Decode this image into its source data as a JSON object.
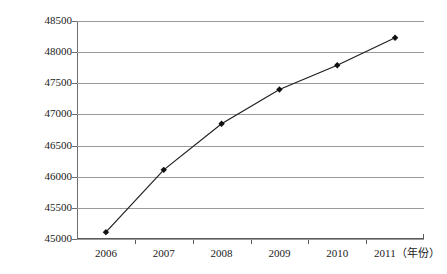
{
  "chart_data": {
    "type": "line",
    "title": "",
    "xlabel": "年份",
    "ylabel": "",
    "categories": [
      "2006",
      "2007",
      "2008",
      "2009",
      "2010",
      "2011"
    ],
    "values": [
      45110,
      46110,
      46850,
      47400,
      47790,
      48230
    ],
    "series": [
      {
        "name": "",
        "values": [
          45110,
          46110,
          46850,
          47400,
          47790,
          48230
        ]
      }
    ],
    "ylim": [
      45000,
      48500
    ],
    "y_ticks": [
      45000,
      45500,
      46000,
      46500,
      47000,
      47500,
      48000,
      48500
    ],
    "y_tick_labels": [
      "45000",
      "45500",
      "46000",
      "46500",
      "47000",
      "47500",
      "48000",
      "48500"
    ],
    "x_tick_labels": [
      "2006",
      "2007",
      "2008",
      "2009",
      "2010",
      "2011"
    ],
    "x_last_label_full": "2011（年份）",
    "x_axis_unit_annotation": "（年份）",
    "grid": true,
    "grid_axis": "y",
    "legend": false,
    "legend_position": "none",
    "marker": "diamond",
    "line_color": "#1f1f1f",
    "marker_color": "#111111",
    "grid_color": "#9a9a9a",
    "axis_color": "#5a5a5a",
    "background_color": "#ffffff"
  },
  "artifact": {
    "top_strip_text": ""
  }
}
